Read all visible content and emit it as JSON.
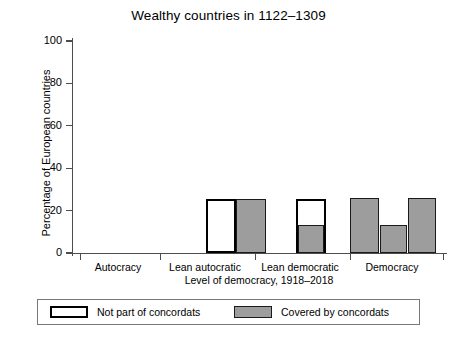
{
  "chart_data": {
    "type": "bar",
    "title": "Wealthy countries in 1122–1309",
    "xlabel": "Level of democracy, 1918–2018",
    "ylabel": "Percentage of European countries",
    "ylim": [
      0,
      100
    ],
    "yticks": [
      0,
      20,
      40,
      60,
      80,
      100
    ],
    "ytick_labels": [
      "0",
      "20",
      "40",
      "60",
      "80",
      "100"
    ],
    "grid": false,
    "legend_position": "bottom",
    "categories": [
      "Autocracy",
      "Lean autocratic",
      "Lean democratic",
      "Democracy"
    ],
    "legend": [
      {
        "name": "Not part of concordats",
        "style": "hollow",
        "color": "#ffffff",
        "edge": "#000000"
      },
      {
        "name": "Covered by concordats",
        "style": "filled",
        "color": "#9d9d9d",
        "edge": "#1a1a1a"
      }
    ],
    "series": [
      {
        "name": "Not part of concordats",
        "values": [
          0,
          0,
          25.5,
          0
        ]
      },
      {
        "name": "Covered by concordats",
        "values": [
          0,
          0,
          13.2,
          25.8
        ]
      }
    ],
    "bars": [
      {
        "label": "Autocracy",
        "series": "Not part of concordats",
        "value": 0,
        "style": "hollow",
        "x": 80,
        "width": 30
      },
      {
        "label": "Autocracy",
        "series": "Covered by concordats",
        "value": 0,
        "style": "filled",
        "x": 112,
        "width": 30
      },
      {
        "label": "Lean autocratic",
        "series": "Not part of concordats",
        "value": 0,
        "style": "hollow",
        "x": 150,
        "width": 30
      },
      {
        "label": "Lean autocratic",
        "series": "Covered by concordats",
        "value": 0,
        "style": "filled",
        "x": 182,
        "width": 30
      },
      {
        "label": "Lean democratic A",
        "series": "Not part of concordats",
        "value": 25.5,
        "style": "hollow",
        "x": 206,
        "width": 30
      },
      {
        "label": "Lean democratic A",
        "series": "Covered by concordats",
        "value": 25.5,
        "style": "filled",
        "x": 236,
        "width": 30
      },
      {
        "label": "Lean democratic B hollow",
        "series": "Not part of concordats",
        "value": 25.5,
        "style": "hollow",
        "x": 296,
        "width": 30
      },
      {
        "label": "Lean democratic B filled",
        "series": "Covered by concordats",
        "value": 13.2,
        "style": "filled",
        "x": 298,
        "width": 26
      },
      {
        "label": "Democracy 1",
        "series": "Covered by concordats",
        "value": 25.8,
        "style": "filled",
        "x": 350,
        "width": 29
      },
      {
        "label": "Democracy 2",
        "series": "Covered by concordats",
        "value": 13.4,
        "style": "filled",
        "x": 380,
        "width": 27
      },
      {
        "label": "Democracy 3",
        "series": "Covered by concordats",
        "value": 26.0,
        "style": "filled",
        "x": 408,
        "width": 28
      }
    ],
    "category_tick_positions": [
      80,
      160,
      255,
      350,
      443
    ],
    "category_label_positions": [
      118,
      205,
      300,
      392
    ]
  }
}
